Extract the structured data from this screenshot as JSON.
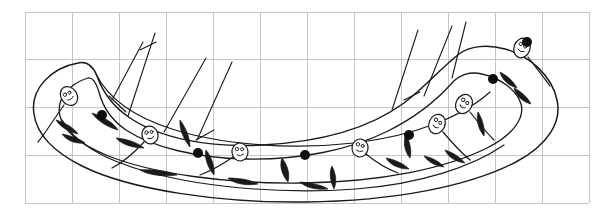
{
  "figure": {
    "background_color": "#ffffff",
    "ink_color": "#1a1a1a",
    "grid_color": "#b8b8b8"
  },
  "grid": {
    "visible": true,
    "left": 25,
    "top": 12,
    "right": 589,
    "bottom": 203,
    "cell_size": 47,
    "columns": 12,
    "rows": 4,
    "vertical_lines": [
      25,
      72,
      119,
      166,
      213,
      260,
      307,
      354,
      401,
      448,
      495,
      542,
      589
    ],
    "horizontal_lines": [
      12,
      59,
      107,
      155,
      203
    ],
    "stroke_width": 0.8
  },
  "artifact": {
    "outline_stroke_width": 1.5,
    "motif_stroke_width": 1.2,
    "outer_outline_path": "M 78 63 C 50 68 30 90 34 114 C 37 136 56 153 82 166 C 130 190 220 203 305 202 C 395 201 470 186 516 162 C 548 145 562 122 557 100 C 552 76 530 56 505 49 C 487 44 470 46 459 54 C 441 68 424 88 404 103 C 370 128 320 142 262 145 C 208 148 160 138 130 118 C 112 106 102 90 97 76 C 93 66 87 61 78 63 Z",
    "inner_outline_path": "M 88 78 C 68 84 56 100 60 116 C 64 132 82 145 106 155 C 152 174 228 184 303 183 C 382 182 447 168 487 148 C 513 135 525 118 521 104 C 517 90 500 78 482 74 C 470 71 459 75 452 83 C 436 101 414 118 388 131 C 350 150 300 160 246 159 C 196 158 152 147 126 130 C 110 119 102 104 99 92 C 96 82 93 77 88 78 Z",
    "mid_groove_path": "M 62 120 C 74 142 104 160 148 172 C 210 189 290 194 356 189 C 420 184 472 167 504 145",
    "upper_sweep_path": "M 96 74 C 108 98 134 117 172 129 C 222 145 292 150 354 143 C 414 136 462 117 490 92"
  },
  "radiating_lines": {
    "count": 7,
    "left_group": [
      "M 128 116 L 155 33",
      "M 112 100 L 143 42",
      "M 164 132 L 206 58",
      "M 197 140 L 232 62"
    ],
    "right_group": [
      "M 392 110 L 418 30",
      "M 424 96 L 452 26",
      "M 452 78 L 466 22"
    ],
    "cross_ticks": [
      "M 109 96 L 126 112",
      "M 140 50 L 156 42",
      "M 196 140 L 214 130",
      "M 404 100 L 420 92"
    ]
  },
  "motifs": {
    "type": "tadpole-fish",
    "count": 7,
    "items": [
      {
        "id": 1,
        "head_cx": 69,
        "head_cy": 96,
        "head_rx": 8,
        "head_ry": 10,
        "rotation": -35,
        "tail_path": "M 64 105 C 52 122 44 135 38 142"
      },
      {
        "id": 2,
        "head_cx": 150,
        "head_cy": 135,
        "head_rx": 8,
        "head_ry": 9,
        "rotation": -18,
        "tail_path": "M 144 142 C 132 155 120 164 112 168"
      },
      {
        "id": 3,
        "head_cx": 240,
        "head_cy": 152,
        "head_rx": 8,
        "head_ry": 9,
        "rotation": -8,
        "tail_path": "M 233 157 C 220 166 208 172 200 175"
      },
      {
        "id": 4,
        "head_cx": 360,
        "head_cy": 148,
        "head_rx": 8,
        "head_ry": 9,
        "rotation": 8,
        "tail_path": "M 366 154 C 378 164 390 170 398 173"
      },
      {
        "id": 5,
        "head_cx": 437,
        "head_cy": 124,
        "head_rx": 8,
        "head_ry": 10,
        "rotation": 24,
        "tail_path": "M 443 132 C 454 145 464 155 470 160"
      },
      {
        "id": 6,
        "head_cx": 464,
        "head_cy": 104,
        "head_rx": 8,
        "head_ry": 10,
        "rotation": 28,
        "tail_path": "M 470 112 C 480 125 489 135 494 140"
      },
      {
        "id": 7,
        "head_cx": 522,
        "head_cy": 48,
        "head_rx": 8,
        "head_ry": 10,
        "rotation": 20,
        "tail_path": "M 528 57 C 538 70 546 80 550 86"
      }
    ],
    "leaf_flicks": [
      "M 92 113 C 104 117 114 123 118 130 C 110 128 98 122 92 113 Z",
      "M 116 138 C 128 139 138 143 144 148 C 134 148 122 145 116 138 Z",
      "M 180 120 C 186 128 190 138 190 147 C 184 140 179 129 180 120 Z",
      "M 140 170 C 154 169 168 171 177 175 C 164 177 148 175 140 170 Z",
      "M 206 150 C 212 158 215 167 214 175 C 208 168 204 158 206 150 Z",
      "M 228 178 C 240 178 251 180 258 184 C 247 186 234 184 228 178 Z",
      "M 282 158 C 288 166 290 174 288 182 C 282 175 279 166 282 158 Z",
      "M 300 182 C 312 183 322 185 328 189 C 317 190 306 188 300 182 Z",
      "M 332 166 C 336 174 337 182 334 189 C 330 181 329 172 332 166 Z",
      "M 386 158 C 396 160 404 164 409 169 C 399 169 390 165 386 158 Z",
      "M 406 134 C 410 142 412 151 410 158 C 404 151 403 141 406 134 Z",
      "M 445 150 C 454 153 461 158 465 163 C 456 162 448 157 445 150 Z",
      "M 478 112 C 483 120 485 129 484 136 C 478 129 476 119 478 112 Z",
      "M 500 72 C 508 76 514 82 517 88 C 509 86 502 80 500 72 Z",
      "M 514 88 C 522 92 528 98 531 104 C 523 102 516 96 514 88 Z",
      "M 56 120 C 66 123 74 128 78 134 C 69 132 60 127 56 120 Z",
      "M 62 134 C 72 136 80 139 85 143 C 76 144 67 141 62 134 Z",
      "M 424 156 C 433 158 440 162 444 167 C 436 166 428 162 424 156 Z"
    ]
  },
  "dots": {
    "color": "#0d0d0d",
    "radius": 5,
    "count": 6,
    "positions": [
      {
        "cx": 102,
        "cy": 115
      },
      {
        "cx": 198,
        "cy": 153
      },
      {
        "cx": 305,
        "cy": 155
      },
      {
        "cx": 409,
        "cy": 135
      },
      {
        "cx": 493,
        "cy": 79
      },
      {
        "cx": 527,
        "cy": 42
      }
    ]
  }
}
